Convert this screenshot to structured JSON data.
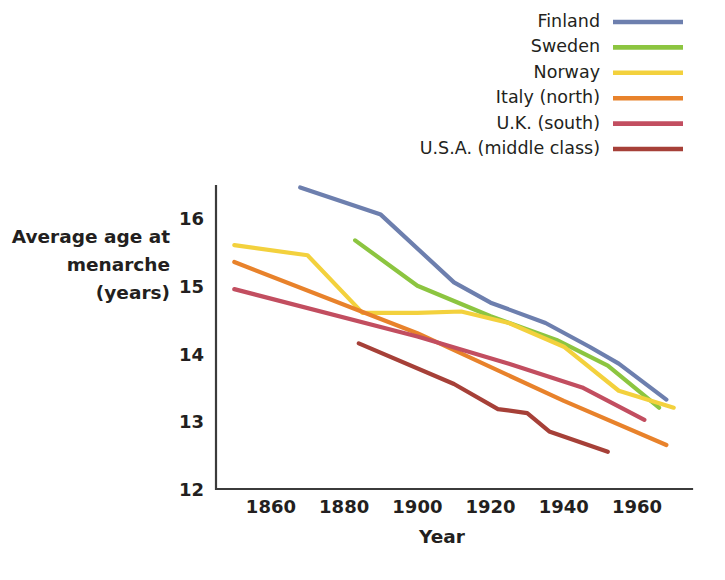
{
  "chart_data": {
    "type": "line",
    "title": "",
    "xlabel": "Year",
    "ylabel": "Average age at menarche (years)",
    "ylabel_lines": [
      "Average age at",
      "menarche",
      "(years)"
    ],
    "xlim": [
      1845,
      1975
    ],
    "ylim": [
      12,
      16.6
    ],
    "xticks": [
      1860,
      1880,
      1900,
      1920,
      1940,
      1960
    ],
    "xtick_labels": [
      "1860",
      "1880",
      "1900",
      "1920",
      "1940",
      "1960"
    ],
    "yticks": [
      12,
      13,
      14,
      15,
      16
    ],
    "ytick_labels": [
      "12",
      "13",
      "14",
      "15",
      "16"
    ],
    "grid": false,
    "legend_position": "top-right",
    "series": [
      {
        "name": "Finland",
        "color": "#6d7fae",
        "x": [
          1868,
          1890,
          1910,
          1920,
          1935,
          1947,
          1955,
          1968
        ],
        "values": [
          16.45,
          16.05,
          15.05,
          14.75,
          14.45,
          14.1,
          13.85,
          13.32
        ]
      },
      {
        "name": "Sweden",
        "color": "#8cc540",
        "x": [
          1883,
          1900,
          1920,
          1938,
          1952,
          1966
        ],
        "values": [
          15.67,
          15.0,
          14.55,
          14.2,
          13.82,
          13.2
        ]
      },
      {
        "name": "Norway",
        "color": "#f3d13d",
        "x": [
          1850,
          1870,
          1885,
          1900,
          1912,
          1925,
          1940,
          1955,
          1970
        ],
        "values": [
          15.6,
          15.45,
          14.6,
          14.6,
          14.62,
          14.45,
          14.1,
          13.45,
          13.2
        ]
      },
      {
        "name": "Italy (north)",
        "color": "#e8822b",
        "x": [
          1850,
          1900,
          1940,
          1968
        ],
        "values": [
          15.35,
          14.3,
          13.3,
          12.65
        ]
      },
      {
        "name": "U.K. (south)",
        "color": "#c24e60",
        "x": [
          1850,
          1900,
          1925,
          1945,
          1962
        ],
        "values": [
          14.95,
          14.25,
          13.85,
          13.5,
          13.02
        ]
      },
      {
        "name": "U.S.A. (middle class)",
        "color": "#a64038",
        "x": [
          1884,
          1910,
          1922,
          1930,
          1936,
          1952
        ],
        "values": [
          14.15,
          13.55,
          13.18,
          13.12,
          12.85,
          12.55
        ]
      }
    ]
  },
  "legend": {
    "items": [
      {
        "label": "Finland",
        "color": "#6d7fae"
      },
      {
        "label": "Sweden",
        "color": "#8cc540"
      },
      {
        "label": "Norway",
        "color": "#f3d13d"
      },
      {
        "label": "Italy (north)",
        "color": "#e8822b"
      },
      {
        "label": "U.K. (south)",
        "color": "#c24e60"
      },
      {
        "label": "U.S.A. (middle class)",
        "color": "#a64038"
      }
    ]
  }
}
